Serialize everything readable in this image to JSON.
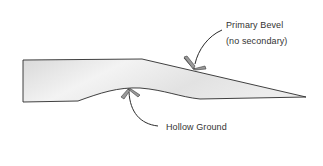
{
  "diagram": {
    "labels": {
      "primary_bevel": "Primary Bevel",
      "primary_bevel_note": "(no secondary)",
      "hollow_ground": "Hollow Ground"
    },
    "colors": {
      "outline": "#2b2b2b",
      "fill_light": "#f4f4f4",
      "fill_dark": "#d6d6d6",
      "arrow_fill": "#9a9a9a",
      "arrow_stroke": "#3a3a3a",
      "text": "#333333",
      "background": "#ffffff"
    }
  }
}
